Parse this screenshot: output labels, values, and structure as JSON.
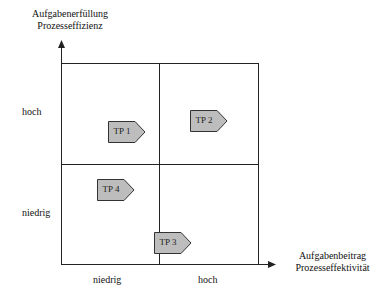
{
  "y_axis": {
    "line1": "Aufgabenerfüllung",
    "line2": "Prozesseffizienz",
    "ticks": [
      "hoch",
      "niedrig"
    ]
  },
  "x_axis": {
    "line1": "Aufgabenbeitrag",
    "line2": "Prozesseffektivität",
    "ticks": [
      "niedrig",
      "hoch"
    ]
  },
  "markers": [
    {
      "label": "TP 1"
    },
    {
      "label": "TP 2"
    },
    {
      "label": "TP 3"
    },
    {
      "label": "TP 4"
    }
  ],
  "colors": {
    "marker_fill": "#bdbdbd",
    "marker_stroke": "#333333",
    "line": "#222222"
  }
}
